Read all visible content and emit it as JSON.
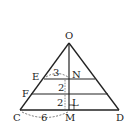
{
  "diagram": {
    "points": {
      "O": {
        "label": "O",
        "x": 69,
        "y": 43
      },
      "E": {
        "label": "E",
        "x": 44,
        "y": 79
      },
      "N": {
        "label": "N",
        "x": 69,
        "y": 79
      },
      "F": {
        "label": "F",
        "x": 31,
        "y": 94
      },
      "L": {
        "label": "L",
        "x": 69,
        "y": 101
      },
      "C": {
        "label": "C",
        "x": 20,
        "y": 110
      },
      "M": {
        "label": "M",
        "x": 69,
        "y": 110
      },
      "D": {
        "label": "D",
        "x": 119,
        "y": 110
      }
    },
    "measurements": {
      "EN": "3",
      "NF_gap": "2",
      "FL_gap": "2",
      "CM": "6"
    },
    "colors": {
      "stroke": "#222222",
      "dashed": "#555555"
    }
  }
}
